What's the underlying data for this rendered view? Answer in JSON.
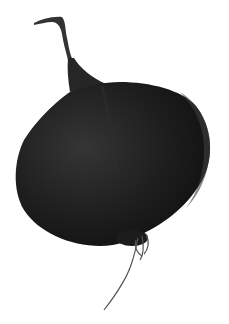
{
  "image": {
    "subject": "dark onion bulb with dried stem and roots",
    "background_color": "#ffffff",
    "colors": {
      "bulb_dark": "#161616",
      "bulb_mid": "#2a2a2a",
      "bulb_highlight": "#3a3a3a",
      "stem": "#303030",
      "roots": "#4a4a4a"
    }
  }
}
